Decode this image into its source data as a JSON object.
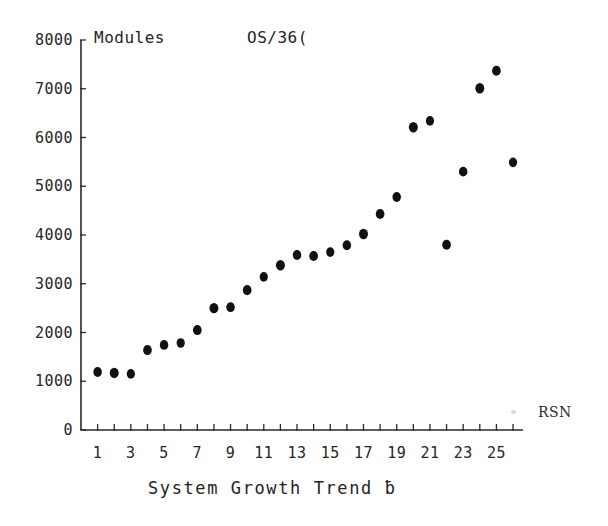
{
  "figure": {
    "title_left": "Modules",
    "title_right": "OS/36(",
    "corner_label": "RSN",
    "x_axis_caption": "System Growth Trend ƀ"
  },
  "chart_data": {
    "type": "scatter",
    "xlabel": "System Growth Trend b",
    "ylabel": "Modules",
    "legend": [],
    "grid": false,
    "xlim": [
      0,
      26.6
    ],
    "ylim": [
      0,
      8000
    ],
    "x_tick_labels": [
      "1",
      "3",
      "5",
      "7",
      "9",
      "11",
      "13",
      "15",
      "17",
      "19",
      "21",
      "23",
      "25"
    ],
    "x_tick_values": [
      1,
      3,
      5,
      7,
      9,
      11,
      13,
      15,
      17,
      19,
      21,
      23,
      25
    ],
    "x_minor_ticks": [
      2,
      4,
      6,
      8,
      10,
      12,
      14,
      16,
      18,
      20,
      22,
      24,
      26
    ],
    "y_tick_labels": [
      "0",
      "1000",
      "2000",
      "3000",
      "4000",
      "5000",
      "6000",
      "7000",
      "8000"
    ],
    "y_tick_values": [
      0,
      1000,
      2000,
      3000,
      4000,
      5000,
      6000,
      7000,
      8000
    ],
    "marker": "filled-circle",
    "marker_color": "#111111",
    "x": [
      1,
      2,
      3,
      4,
      5,
      6,
      7,
      8,
      9,
      10,
      11,
      12,
      13,
      14,
      15,
      16,
      17,
      18,
      19,
      20,
      21,
      22,
      23,
      24,
      25,
      26
    ],
    "values": [
      1190,
      1170,
      1150,
      1640,
      1745,
      1785,
      2050,
      2500,
      2520,
      2870,
      3140,
      3380,
      3590,
      3570,
      3650,
      3790,
      4020,
      4430,
      4780,
      6210,
      6340,
      3800,
      5300,
      7010,
      7370,
      5490
    ],
    "points": [
      {
        "rsn": 1,
        "modules": 1190
      },
      {
        "rsn": 2,
        "modules": 1170
      },
      {
        "rsn": 3,
        "modules": 1150
      },
      {
        "rsn": 4,
        "modules": 1640
      },
      {
        "rsn": 5,
        "modules": 1745
      },
      {
        "rsn": 6,
        "modules": 1785
      },
      {
        "rsn": 7,
        "modules": 2050
      },
      {
        "rsn": 8,
        "modules": 2500
      },
      {
        "rsn": 9,
        "modules": 2520
      },
      {
        "rsn": 10,
        "modules": 2870
      },
      {
        "rsn": 11,
        "modules": 3140
      },
      {
        "rsn": 12,
        "modules": 3380
      },
      {
        "rsn": 13,
        "modules": 3590
      },
      {
        "rsn": 14,
        "modules": 3570
      },
      {
        "rsn": 15,
        "modules": 3650
      },
      {
        "rsn": 16,
        "modules": 3790
      },
      {
        "rsn": 17,
        "modules": 4020
      },
      {
        "rsn": 18,
        "modules": 4430
      },
      {
        "rsn": 19,
        "modules": 4780
      },
      {
        "rsn": 20,
        "modules": 6210
      },
      {
        "rsn": 21,
        "modules": 6340
      },
      {
        "rsn": 22,
        "modules": 3800
      },
      {
        "rsn": 23,
        "modules": 5300
      },
      {
        "rsn": 24,
        "modules": 7010
      },
      {
        "rsn": 25,
        "modules": 7370
      },
      {
        "rsn": 26,
        "modules": 5490
      }
    ]
  }
}
